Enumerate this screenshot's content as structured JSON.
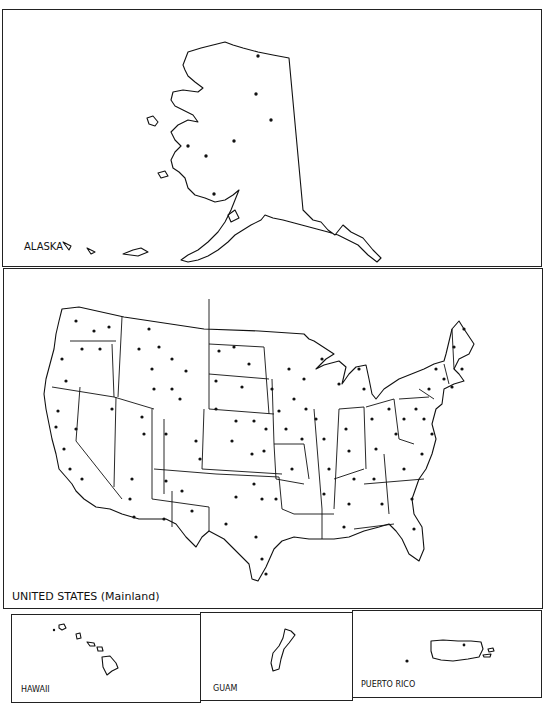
{
  "panels": {
    "alaska": {
      "label": "ALASKA"
    },
    "mainland": {
      "label": "UNITED STATES (Mainland)"
    },
    "hawaii": {
      "label": "HAWAII"
    },
    "guam": {
      "label": "GUAM"
    },
    "puerto_rico": {
      "label": "PUERTO RICO"
    }
  },
  "colors": {
    "ink": "#111111",
    "background": "#ffffff"
  },
  "markers": {
    "type": "city-dot",
    "description": "point locations marked as black dots"
  }
}
